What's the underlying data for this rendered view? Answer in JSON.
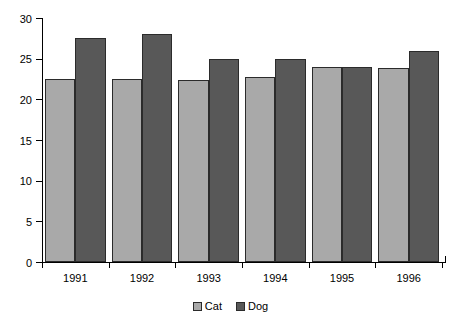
{
  "chart_data": {
    "type": "bar",
    "title": "",
    "subtitle": "",
    "xlabel": "",
    "ylabel": "",
    "categories": [
      "1991",
      "1992",
      "1993",
      "1994",
      "1995",
      "1996"
    ],
    "series": [
      {
        "name": "Cat",
        "color": "#a9a9a9",
        "values": [
          22.5,
          22.5,
          22.4,
          22.8,
          24.0,
          23.9
        ]
      },
      {
        "name": "Dog",
        "color": "#585858",
        "values": [
          27.5,
          28.0,
          25.0,
          25.0,
          24.0,
          26.0
        ]
      }
    ],
    "ylim": [
      0,
      30
    ],
    "yticks": [
      0,
      5,
      10,
      15,
      20,
      25,
      30
    ],
    "ytick_labels": [
      "0",
      "5",
      "10",
      "15",
      "20",
      "25",
      "30"
    ],
    "grid": false,
    "legend_position": "bottom",
    "legend_entries": [
      "Cat",
      "Dog"
    ]
  }
}
